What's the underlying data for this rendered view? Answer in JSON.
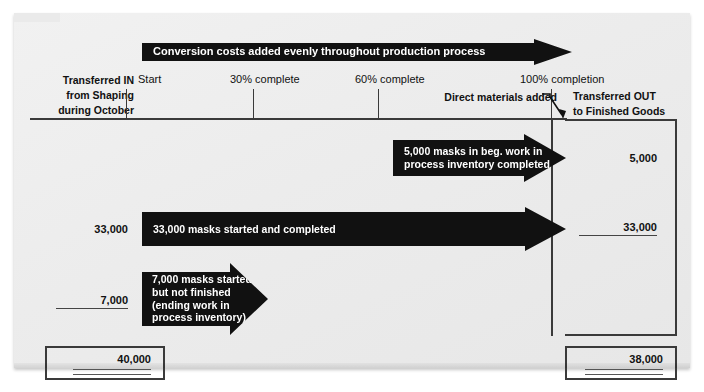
{
  "exhibit": {
    "title": "Conversion costs and units flow diagram",
    "banner": {
      "label": "Conversion costs added evenly throughout production process"
    },
    "columns": {
      "transferred_in": "Transferred IN\nfrom Shaping\nduring October",
      "transferred_out": "Transferred OUT\nto Finished Goods"
    },
    "scale": [
      {
        "label": "Start",
        "x": 126
      },
      {
        "label": "30% complete",
        "x": 253
      },
      {
        "label": "60% complete",
        "x": 378
      },
      {
        "label": "100% completion",
        "x": 552
      }
    ],
    "annotation": {
      "direct_materials": "Direct materials added"
    },
    "flows": [
      {
        "in_value": "",
        "text": "5,000 masks in beg. work in\nprocess inventory completed",
        "out_value": "5,000",
        "out_underline": "none"
      },
      {
        "in_value": "33,000",
        "text": "33,000 masks started and completed",
        "out_value": "33,000",
        "out_underline": "single"
      },
      {
        "in_value": "7,000",
        "text": "7,000 masks started\nbut not finished\n(ending work in\nprocess inventory)",
        "out_value": "",
        "out_underline": "none"
      }
    ],
    "totals": {
      "in_total": "40,000",
      "out_total": "38,000"
    },
    "colors": {
      "panel": "#ececec",
      "arrow": "#111111",
      "rule": "#3a3a3a",
      "text": "#111111"
    }
  }
}
